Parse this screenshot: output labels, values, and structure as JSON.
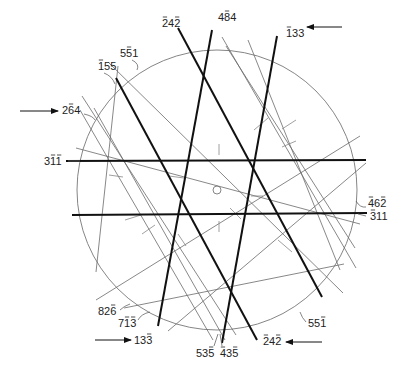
{
  "figure": {
    "type": "kikuchi-line-diagram",
    "circle": {
      "cx": 217,
      "cy": 190,
      "r": 140,
      "stroke": "#777777"
    },
    "center_marker": {
      "cx": 217,
      "cy": 190,
      "r": 4,
      "stroke": "#777777"
    },
    "thick_lines": [
      {
        "id": "242-bar-top",
        "x1": 178,
        "y1": 28,
        "x2": 322,
        "y2": 297
      },
      {
        "id": "484",
        "x1": 212,
        "y1": 30,
        "x2": 158,
        "y2": 326
      },
      {
        "id": "133-top",
        "x1": 277,
        "y1": 36,
        "x2": 222,
        "y2": 343
      },
      {
        "id": "155",
        "x1": 116,
        "y1": 78,
        "x2": 257,
        "y2": 340
      },
      {
        "id": "311-bar",
        "x1": 66,
        "y1": 161,
        "x2": 366,
        "y2": 160
      },
      {
        "id": "311",
        "x1": 72,
        "y1": 215,
        "x2": 367,
        "y2": 213
      }
    ],
    "thin_lines": [
      {
        "x1": 108,
        "y1": 62,
        "x2": 343,
        "y2": 293
      },
      {
        "x1": 222,
        "y1": 37,
        "x2": 356,
        "y2": 268
      },
      {
        "x1": 226,
        "y1": 46,
        "x2": 355,
        "y2": 248
      },
      {
        "x1": 94,
        "y1": 108,
        "x2": 225,
        "y2": 340
      },
      {
        "x1": 80,
        "y1": 110,
        "x2": 213,
        "y2": 340
      },
      {
        "x1": 76,
        "y1": 148,
        "x2": 360,
        "y2": 224
      },
      {
        "x1": 118,
        "y1": 66,
        "x2": 96,
        "y2": 272
      },
      {
        "x1": 96,
        "y1": 300,
        "x2": 360,
        "y2": 136
      },
      {
        "x1": 124,
        "y1": 308,
        "x2": 344,
        "y2": 264
      },
      {
        "x1": 168,
        "y1": 331,
        "x2": 366,
        "y2": 163
      },
      {
        "x1": 82,
        "y1": 96,
        "x2": 236,
        "y2": 335
      },
      {
        "x1": 248,
        "y1": 40,
        "x2": 340,
        "y2": 270
      }
    ],
    "ticks": [
      {
        "x1": 219,
        "y1": 144,
        "x2": 219,
        "y2": 155
      },
      {
        "x1": 219,
        "y1": 221,
        "x2": 219,
        "y2": 232
      },
      {
        "x1": 169,
        "y1": 176,
        "x2": 184,
        "y2": 178
      },
      {
        "x1": 263,
        "y1": 196,
        "x2": 251,
        "y2": 196
      },
      {
        "x1": 109,
        "y1": 175,
        "x2": 123,
        "y2": 177
      },
      {
        "x1": 125,
        "y1": 220,
        "x2": 141,
        "y2": 215
      },
      {
        "x1": 142,
        "y1": 234,
        "x2": 155,
        "y2": 225
      },
      {
        "x1": 230,
        "y1": 208,
        "x2": 241,
        "y2": 219
      },
      {
        "x1": 254,
        "y1": 130,
        "x2": 268,
        "y2": 118
      },
      {
        "x1": 282,
        "y1": 129,
        "x2": 296,
        "y2": 120
      },
      {
        "x1": 282,
        "y1": 147,
        "x2": 296,
        "y2": 141
      },
      {
        "x1": 178,
        "y1": 234,
        "x2": 186,
        "y2": 246
      },
      {
        "x1": 278,
        "y1": 240,
        "x2": 292,
        "y2": 252
      }
    ],
    "labels": [
      {
        "text": "242",
        "over": [
          0,
          2
        ],
        "x": 162,
        "y": 27
      },
      {
        "text": "484",
        "over": [
          1
        ],
        "x": 218,
        "y": 21
      },
      {
        "text": "133",
        "over": [
          0
        ],
        "x": 286,
        "y": 37
      },
      {
        "text": "551",
        "over": [
          1
        ],
        "x": 120,
        "y": 57
      },
      {
        "text": "155",
        "over": [
          0
        ],
        "x": 98,
        "y": 70
      },
      {
        "text": "264",
        "over": [
          1
        ],
        "x": 62,
        "y": 114
      },
      {
        "text": "311",
        "over": [
          1,
          2
        ],
        "x": 44,
        "y": 165
      },
      {
        "text": "462",
        "over": [
          0,
          2
        ],
        "x": 368,
        "y": 207
      },
      {
        "text": "311",
        "over": [
          0
        ],
        "x": 370,
        "y": 220
      },
      {
        "text": "826",
        "over": [
          2
        ],
        "x": 98,
        "y": 315
      },
      {
        "text": "713",
        "over": [
          1,
          2
        ],
        "x": 118,
        "y": 327
      },
      {
        "text": "551",
        "over": [
          2
        ],
        "x": 308,
        "y": 327
      },
      {
        "text": "133",
        "over": [
          2
        ],
        "x": 134,
        "y": 344
      },
      {
        "text": "242",
        "over": [
          0,
          2
        ],
        "x": 263,
        "y": 345
      },
      {
        "text": "535",
        "over": [
          2
        ],
        "x": 196,
        "y": 357
      },
      {
        "text": "435",
        "over": [
          0,
          2
        ],
        "x": 220,
        "y": 357
      }
    ],
    "leaders": [
      {
        "d": "M104 73 Q112 76 115 84"
      },
      {
        "d": "M132 60 Q140 64 137 70"
      },
      {
        "d": "M84 114 Q93 116 95 120"
      },
      {
        "d": "M68 161 L80 161"
      },
      {
        "d": "M366 207 Q360 208 356 201"
      },
      {
        "d": "M366 216 L358 214"
      },
      {
        "d": "M120 310 Q124 306 130 304"
      },
      {
        "d": "M138 320 Q141 314 150 312"
      },
      {
        "d": "M306 322 Q302 318 300 312"
      },
      {
        "d": "M214 346 L218 334"
      },
      {
        "d": "M222 346 L220 334"
      }
    ],
    "arrows": [
      {
        "id": "arrow-133-top",
        "x1": 342,
        "y1": 27,
        "x2": 307,
        "y2": 27
      },
      {
        "id": "arrow-264",
        "x1": 20,
        "y1": 111,
        "x2": 58,
        "y2": 111
      },
      {
        "id": "arrow-133-bottom",
        "x1": 95,
        "y1": 340,
        "x2": 131,
        "y2": 340
      },
      {
        "id": "arrow-242-bottom",
        "x1": 322,
        "y1": 342,
        "x2": 286,
        "y2": 342
      }
    ]
  }
}
